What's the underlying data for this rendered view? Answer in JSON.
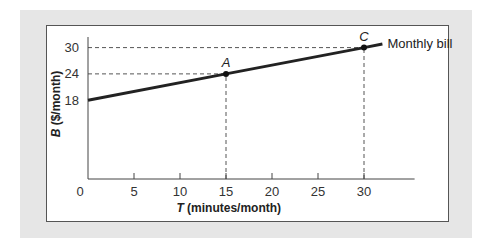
{
  "chart_data": {
    "type": "line",
    "title": "",
    "xlabel_var": "T",
    "xlabel_rest": " (minutes/month)",
    "ylabel_var": "B",
    "ylabel_rest": " ($/month)",
    "xlim": [
      0,
      35
    ],
    "ylim": [
      0,
      32
    ],
    "x_ticks": [
      0,
      5,
      10,
      15,
      20,
      25,
      30
    ],
    "y_ticks": [
      18,
      24,
      30
    ],
    "grid": false,
    "series": [
      {
        "name": "Monthly bill",
        "x": [
          0,
          15,
          30,
          32
        ],
        "y": [
          18,
          24,
          30,
          30.8
        ],
        "color": "#222222"
      }
    ],
    "points": [
      {
        "label": "A",
        "x": 15,
        "y": 24
      },
      {
        "label": "C",
        "x": 30,
        "y": 30
      }
    ],
    "reference_lines": [
      {
        "from": "y-axis",
        "at_y": 30,
        "to_x": 30
      },
      {
        "from": "y-axis",
        "at_y": 24,
        "to_x": 15
      },
      {
        "from": "x-axis",
        "at_x": 15,
        "to_y": 24
      },
      {
        "from": "x-axis",
        "at_x": 30,
        "to_y": 30
      }
    ]
  }
}
